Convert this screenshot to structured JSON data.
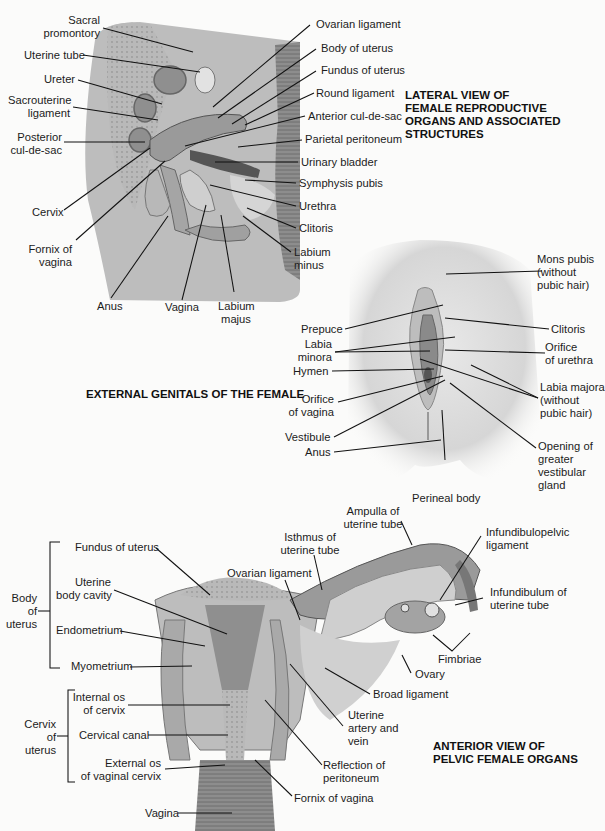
{
  "figures": [
    {
      "id": "lateral",
      "title": [
        "LATERAL VIEW OF",
        "FEMALE REPRODUCTIVE",
        "ORGANS AND ASSOCIATED",
        "STRUCTURES"
      ],
      "labels": {
        "sacral_promontory": [
          "Sacral",
          "promontory"
        ],
        "uterine_tube": "Uterine tube",
        "ureter": "Ureter",
        "sacrouterine_ligament": [
          "Sacrouterine",
          "ligament"
        ],
        "posterior_cul_de_sac": [
          "Posterior",
          "cul-de-sac"
        ],
        "cervix": "Cervix",
        "fornix_of_vagina": [
          "Fornix of",
          "vagina"
        ],
        "anus": "Anus",
        "vagina": "Vagina",
        "labium_majus": [
          "Labium",
          "majus"
        ],
        "ovarian_ligament": "Ovarian ligament",
        "body_of_uterus": "Body of uterus",
        "fundus_of_uterus": "Fundus of uterus",
        "round_ligament": "Round ligament",
        "anterior_cul_de_sac": "Anterior cul-de-sac",
        "parietal_peritoneum": "Parietal peritoneum",
        "urinary_bladder": "Urinary bladder",
        "symphysis_pubis": "Symphysis pubis",
        "urethra": "Urethra",
        "clitoris": "Clitoris",
        "labium_minus": [
          "Labium",
          "minus"
        ]
      }
    },
    {
      "id": "external",
      "title": [
        "EXTERNAL GENITALS OF THE FEMALE"
      ],
      "labels": {
        "mons_pubis": [
          "Mons pubis",
          "(without",
          "pubic hair)"
        ],
        "prepuce": "Prepuce",
        "clitoris": "Clitoris",
        "labia_minora": [
          "Labia",
          "minora"
        ],
        "orifice_of_urethra": [
          "Orifice",
          "of urethra"
        ],
        "hymen": "Hymen",
        "orifice_of_vagina": [
          "Orifice",
          "of vagina"
        ],
        "labia_majora": [
          "Labia majora",
          "(without",
          "pubic hair)"
        ],
        "vestibule": "Vestibule",
        "anus": "Anus",
        "opening_greater_vestibular_gland": [
          "Opening of",
          "greater",
          "vestibular",
          "gland"
        ],
        "perineal_body": "Perineal body"
      }
    },
    {
      "id": "anterior",
      "title": [
        "ANTERIOR VIEW OF",
        "PELVIC FEMALE ORGANS"
      ],
      "groups": {
        "body_of_uterus": [
          "Body",
          "of",
          "uterus"
        ],
        "cervix_of_uterus": [
          "Cervix",
          "of",
          "uterus"
        ]
      },
      "labels": {
        "fundus_of_uterus": "Fundus of uterus",
        "uterine_body_cavity": [
          "Uterine",
          "body cavity"
        ],
        "endometrium": "Endometrium",
        "myometrium": "Myometrium",
        "internal_os": [
          "Internal os",
          "of cervix"
        ],
        "cervical_canal": "Cervical canal",
        "external_os": [
          "External os",
          "of vaginal cervix"
        ],
        "vagina": "Vagina",
        "ampulla": [
          "Ampulla of",
          "uterine tube"
        ],
        "isthmus": [
          "Isthmus of",
          "uterine tube"
        ],
        "ovarian_ligament": "Ovarian ligament",
        "infundibulopelvic_ligament": [
          "Infundibulopelvic",
          "ligament"
        ],
        "infundibulum": [
          "Infundibulum of",
          "uterine tube"
        ],
        "fimbriae": "Fimbriae",
        "ovary": "Ovary",
        "broad_ligament": "Broad ligament",
        "uterine_artery_vein": [
          "Uterine",
          "artery and",
          "vein"
        ],
        "reflection_of_peritoneum": [
          "Reflection of",
          "peritoneum"
        ],
        "fornix_of_vagina": "Fornix of vagina"
      }
    }
  ],
  "colors": {
    "background": "#fbfbfa",
    "tissue_light": "#c9c9c9",
    "tissue_mid": "#a9a9a9",
    "tissue_dark": "#7a7a7a",
    "line": "#111111"
  }
}
